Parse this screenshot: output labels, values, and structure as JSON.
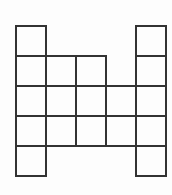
{
  "figure": {
    "background_color": "#fdfdfd",
    "line_color": "#333333",
    "cell_fill_color": "#ffffff",
    "line_width_px": 2.4,
    "origin_x_px": 16,
    "origin_y_px": 26,
    "cell_size_px": 30,
    "columns": 5,
    "rows": 5,
    "total_cells": 16,
    "row_labels": [
      "row-1",
      "row-2",
      "row-3",
      "row-4",
      "row-5"
    ],
    "column_labels": [
      "col-1",
      "col-2",
      "col-3",
      "col-4",
      "col-5"
    ],
    "occupancy": [
      [
        1,
        0,
        0,
        0,
        1
      ],
      [
        1,
        1,
        1,
        0,
        1
      ],
      [
        1,
        1,
        1,
        1,
        1
      ],
      [
        1,
        1,
        1,
        1,
        1
      ],
      [
        1,
        0,
        0,
        0,
        1
      ]
    ],
    "cells": [
      {
        "id": "cell-r1c1",
        "row": 1,
        "col": 1,
        "x": 16,
        "y": 26
      },
      {
        "id": "cell-r1c5",
        "row": 1,
        "col": 5,
        "x": 136,
        "y": 26
      },
      {
        "id": "cell-r2c1",
        "row": 2,
        "col": 1,
        "x": 16,
        "y": 56
      },
      {
        "id": "cell-r2c2",
        "row": 2,
        "col": 2,
        "x": 46,
        "y": 56
      },
      {
        "id": "cell-r2c3",
        "row": 2,
        "col": 3,
        "x": 76,
        "y": 56
      },
      {
        "id": "cell-r2c5",
        "row": 2,
        "col": 5,
        "x": 136,
        "y": 56
      },
      {
        "id": "cell-r3c1",
        "row": 3,
        "col": 1,
        "x": 16,
        "y": 86
      },
      {
        "id": "cell-r3c2",
        "row": 3,
        "col": 2,
        "x": 46,
        "y": 86
      },
      {
        "id": "cell-r3c3",
        "row": 3,
        "col": 3,
        "x": 76,
        "y": 86
      },
      {
        "id": "cell-r3c4",
        "row": 3,
        "col": 4,
        "x": 106,
        "y": 86
      },
      {
        "id": "cell-r3c5",
        "row": 3,
        "col": 5,
        "x": 136,
        "y": 86
      },
      {
        "id": "cell-r4c1",
        "row": 4,
        "col": 1,
        "x": 16,
        "y": 116
      },
      {
        "id": "cell-r4c2",
        "row": 4,
        "col": 2,
        "x": 46,
        "y": 116
      },
      {
        "id": "cell-r4c3",
        "row": 4,
        "col": 3,
        "x": 76,
        "y": 116
      },
      {
        "id": "cell-r4c4",
        "row": 4,
        "col": 4,
        "x": 106,
        "y": 116
      },
      {
        "id": "cell-r4c5",
        "row": 4,
        "col": 5,
        "x": 136,
        "y": 116
      },
      {
        "id": "cell-r5c1",
        "row": 5,
        "col": 1,
        "x": 16,
        "y": 146
      },
      {
        "id": "cell-r5c5",
        "row": 5,
        "col": 5,
        "x": 136,
        "y": 146
      }
    ]
  }
}
